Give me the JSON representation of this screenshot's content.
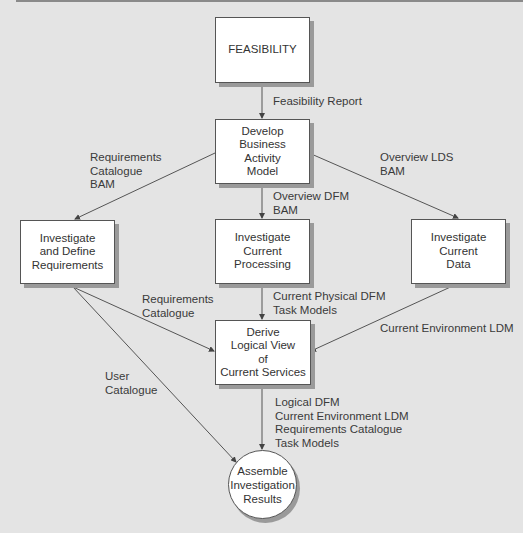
{
  "nodes": {
    "feasibility": "FEASIBILITY",
    "develop_bam": "Develop\nBusiness\nActivity\nModel",
    "investigate_requirements": "Investigate\nand Define\nRequirements",
    "investigate_processing": "Investigate\nCurrent\nProcessing",
    "investigate_data": "Investigate\nCurrent\nData",
    "derive_logical_view": "Derive\nLogical View\nof\nCurrent Services",
    "assemble_results": "Assemble\nInvestigation\nResults"
  },
  "flows": {
    "feasibility_report": "Feasibility Report",
    "requirements_catalogue_bam": "Requirements\nCatalogue\nBAM",
    "overview_dfm_bam": "Overview DFM\nBAM",
    "overview_lds_bam": "Overview LDS\nBAM",
    "requirements_catalogue": "Requirements\nCatalogue",
    "current_physical_dfm": "Current Physical DFM\nTask Models",
    "current_environment_ldm": "Current Environment LDM",
    "user_catalogue": "User\nCatalogue",
    "final_outputs": "Logical DFM\nCurrent Environment LDM\nRequirements Catalogue\nTask Models"
  },
  "colors": {
    "background": "#e4e4e4",
    "box_fill": "#ffffff",
    "line": "#555555",
    "shadow": "#9a9a9a"
  }
}
